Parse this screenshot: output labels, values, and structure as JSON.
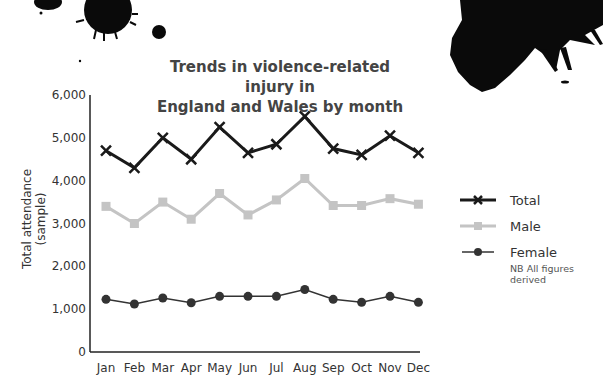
{
  "chart_data": {
    "type": "line",
    "title": "Trends in violence-related injury in England and Wales by month",
    "title_lines": [
      "Trends in violence-related injury in",
      "England and Wales by month"
    ],
    "xlabel": "",
    "ylabel": "Total attendance (sample)",
    "categories": [
      "Jan",
      "Feb",
      "Mar",
      "Apr",
      "May",
      "Jun",
      "Jul",
      "Aug",
      "Sep",
      "Oct",
      "Nov",
      "Dec"
    ],
    "ylim": [
      0,
      6000
    ],
    "yticks": [
      0,
      1000,
      2000,
      3000,
      4000,
      5000,
      6000
    ],
    "ytick_labels": [
      "0",
      "1,000",
      "2,000",
      "3,000",
      "4,000",
      "5,000",
      "6,000"
    ],
    "grid": false,
    "legend_position": "right",
    "series": [
      {
        "name": "Total",
        "marker": "x",
        "color": "#1a1a1a",
        "values": [
          4700,
          4300,
          5000,
          4500,
          5250,
          4650,
          4850,
          5500,
          4750,
          4600,
          5050,
          4650
        ]
      },
      {
        "name": "Male",
        "marker": "square",
        "color": "#c4c4c4",
        "values": [
          3400,
          3000,
          3500,
          3100,
          3700,
          3200,
          3550,
          4050,
          3420,
          3420,
          3580,
          3450
        ]
      },
      {
        "name": "Female",
        "marker": "circle",
        "color": "#333333",
        "values": [
          1230,
          1120,
          1260,
          1150,
          1300,
          1300,
          1300,
          1460,
          1230,
          1160,
          1300,
          1160
        ]
      }
    ],
    "annotations": [
      "NB All figures derived"
    ]
  }
}
